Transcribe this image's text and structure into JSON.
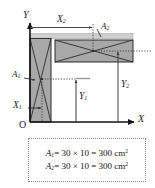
{
  "figure": {
    "type": "centroid-composite-area-diagram",
    "axes": {
      "x_label": "X",
      "y_label": "Y",
      "origin_label": "O"
    },
    "dimension_labels": {
      "x1": {
        "base": "X",
        "sub": "1"
      },
      "x2": {
        "base": "X",
        "sub": "2"
      },
      "y1": {
        "base": "Y",
        "sub": "1"
      },
      "y2": {
        "base": "Y",
        "sub": "2"
      }
    },
    "area_labels": {
      "a1": {
        "base": "A",
        "sub": "1"
      },
      "a2": {
        "base": "A",
        "sub": "2"
      }
    },
    "formulas": [
      {
        "symbol": "A",
        "subscript": "1",
        "expression": "= 30 × 10 = 300 cm",
        "exponent": "2",
        "width": "30",
        "thickness": "10",
        "area": "300",
        "unit": "cm²"
      },
      {
        "symbol": "A",
        "subscript": "2",
        "expression": "= 30 × 10 = 300 cm",
        "exponent": "2",
        "width": "30",
        "thickness": "10",
        "area": "300",
        "unit": "cm²"
      }
    ],
    "colors": {
      "shape_fill": "#a8a8a8",
      "shape_stroke": "#2b2b2b",
      "axis": "#111111",
      "dimension_line": "#4a4a4a",
      "dotted_line": "#3a3a3a",
      "box_border": "#8a8a8a",
      "background": "#ffffff"
    }
  }
}
